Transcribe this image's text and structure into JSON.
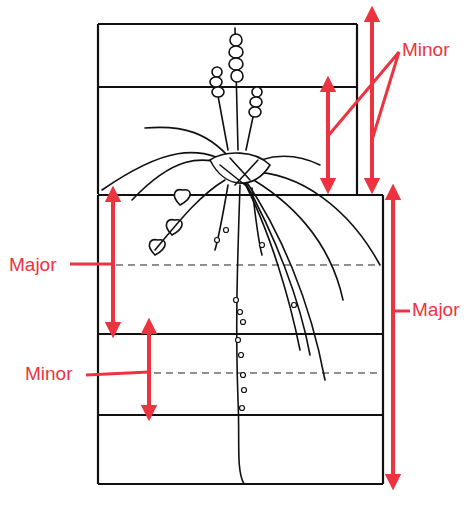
{
  "diagram": {
    "accent_color": "#ee3340",
    "line_color": "#111111",
    "labels": {
      "minor_top": "Minor",
      "major_left": "Major",
      "minor_left": "Minor",
      "major_right": "Major"
    },
    "annotations": [
      {
        "label": "Minor",
        "position": "top-right",
        "arrows": 2
      },
      {
        "label": "Major",
        "position": "left",
        "arrows": 1
      },
      {
        "label": "Minor",
        "position": "left-lower",
        "arrows": 1
      },
      {
        "label": "Major",
        "position": "right",
        "arrows": 1
      }
    ],
    "icons": {
      "illustration": "plant-illustration"
    }
  }
}
